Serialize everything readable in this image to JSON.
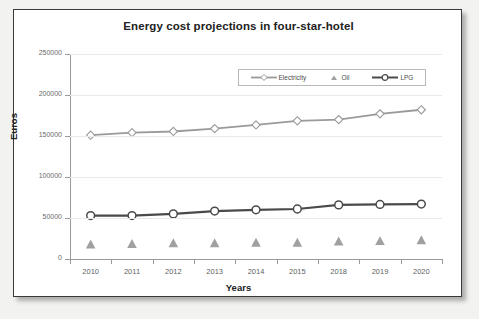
{
  "chart_data": {
    "type": "line",
    "title": "Energy cost projections in four-star-hotel",
    "xlabel": "Years",
    "ylabel": "Euros",
    "categories": [
      "2010",
      "2011",
      "2012",
      "2013",
      "2014",
      "2015",
      "2018",
      "2019",
      "2020"
    ],
    "ylim": [
      0,
      250000
    ],
    "ytick_labels": [
      "0",
      "50000",
      "100000",
      "150000",
      "200000",
      "250000"
    ],
    "ytick_values": [
      0,
      50000,
      100000,
      150000,
      200000,
      250000
    ],
    "grid": true,
    "legend_position": "top-right inside plot",
    "series": [
      {
        "name": "Electricity",
        "color": "#9a9a9a",
        "marker": "diamond",
        "values": [
          151000,
          154000,
          155500,
          159000,
          163500,
          168500,
          170000,
          177000,
          182000
        ]
      },
      {
        "name": "Oil",
        "color": "#a0a0a0",
        "marker": "triangle",
        "line": false,
        "values": [
          17500,
          18000,
          19000,
          19000,
          19500,
          19500,
          21000,
          21500,
          22500
        ]
      },
      {
        "name": "LPG",
        "color": "#4a4a4a",
        "marker": "circle",
        "values": [
          53000,
          53000,
          55000,
          58500,
          60000,
          61000,
          66000,
          66500,
          67000
        ]
      }
    ]
  },
  "colors": {
    "frame_border": "#3a3a3a",
    "page_background": "#f2f2f0",
    "plot_background": "#ffffff",
    "axis": "#9a9a9a",
    "gridline": "#e9e9e9",
    "electricity": "#9a9a9a",
    "oil": "#a0a0a0",
    "lpg": "#4a4a4a"
  }
}
